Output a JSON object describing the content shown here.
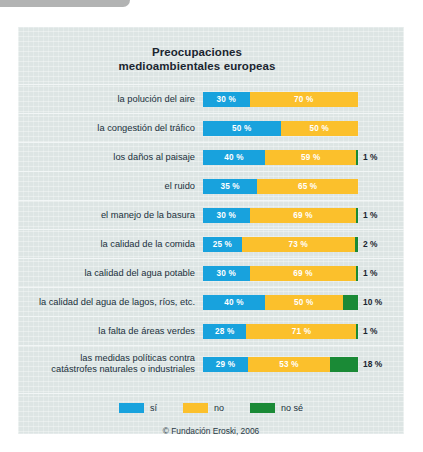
{
  "chart_data": {
    "type": "bar",
    "subtype": "stacked-horizontal-100pct",
    "title": "Preocupaciones medioambientales europeas",
    "title_line1": "Preocupaciones",
    "title_line2": "medioambientales europeas",
    "xlabel": "",
    "ylabel": "",
    "xlim": [
      0,
      100
    ],
    "grid": false,
    "legend_position": "bottom",
    "units": "%",
    "credit": "© Fundación Eroski, 2006",
    "categories": [
      "la polución del aire",
      "la congestión del tráfico",
      "los daños al paisaje",
      "el ruido",
      "el manejo de la basura",
      "la calidad de la comida",
      "la calidad del agua potable",
      "la calidad del agua de lagos, ríos, etc.",
      "la falta de áreas verdes",
      "las medidas políticas contra catástrofes naturales o industriales"
    ],
    "series": [
      {
        "name": "sí",
        "color": "#18a2dd",
        "values": [
          30,
          50,
          40,
          35,
          30,
          25,
          30,
          40,
          28,
          29
        ]
      },
      {
        "name": "no",
        "color": "#fbc02c",
        "values": [
          70,
          50,
          59,
          65,
          69,
          73,
          69,
          50,
          71,
          53
        ]
      },
      {
        "name": "no sé",
        "color": "#1a8a36",
        "values": [
          0,
          0,
          1,
          0,
          1,
          2,
          1,
          10,
          1,
          18
        ]
      }
    ]
  },
  "legend": {
    "items": [
      {
        "label": "sí",
        "color": "#18a2dd"
      },
      {
        "label": "no",
        "color": "#fbc02c"
      },
      {
        "label": "no sé",
        "color": "#1a8a36"
      }
    ]
  },
  "rows": [
    {
      "label": "la polución del aire",
      "label_line2": "",
      "si": 30,
      "no": 70,
      "ns": 0,
      "si_text": "30 %",
      "no_text": "70 %",
      "ns_text": "",
      "outside_text": ""
    },
    {
      "label": "la congestión del tráfico",
      "label_line2": "",
      "si": 50,
      "no": 50,
      "ns": 0,
      "si_text": "50 %",
      "no_text": "50 %",
      "ns_text": "",
      "outside_text": ""
    },
    {
      "label": "los daños al paisaje",
      "label_line2": "",
      "si": 40,
      "no": 59,
      "ns": 1,
      "si_text": "40 %",
      "no_text": "59 %",
      "ns_text": "",
      "outside_text": "1 %"
    },
    {
      "label": "el ruido",
      "label_line2": "",
      "si": 35,
      "no": 65,
      "ns": 0,
      "si_text": "35 %",
      "no_text": "65 %",
      "ns_text": "",
      "outside_text": ""
    },
    {
      "label": "el manejo de la basura",
      "label_line2": "",
      "si": 30,
      "no": 69,
      "ns": 1,
      "si_text": "30 %",
      "no_text": "69 %",
      "ns_text": "",
      "outside_text": "1 %"
    },
    {
      "label": "la calidad de la comida",
      "label_line2": "",
      "si": 25,
      "no": 73,
      "ns": 2,
      "si_text": "25 %",
      "no_text": "73 %",
      "ns_text": "",
      "outside_text": "2 %"
    },
    {
      "label": "la calidad del agua potable",
      "label_line2": "",
      "si": 30,
      "no": 69,
      "ns": 1,
      "si_text": "30 %",
      "no_text": "69 %",
      "ns_text": "",
      "outside_text": "1 %"
    },
    {
      "label": "la calidad del agua de lagos, ríos, etc.",
      "label_line2": "",
      "si": 40,
      "no": 50,
      "ns": 10,
      "si_text": "40 %",
      "no_text": "50 %",
      "ns_text": "",
      "outside_text": "10 %"
    },
    {
      "label": "la falta de áreas verdes",
      "label_line2": "",
      "si": 28,
      "no": 71,
      "ns": 1,
      "si_text": "28 %",
      "no_text": "71 %",
      "ns_text": "",
      "outside_text": "1 %"
    },
    {
      "label": "las medidas políticas contra",
      "label_line2": "catástrofes naturales o industriales",
      "si": 29,
      "no": 53,
      "ns": 18,
      "si_text": "29 %",
      "no_text": "53 %",
      "ns_text": "",
      "outside_text": "18 %"
    }
  ],
  "credit": {
    "text": "© Fundación Eroski, 2006"
  },
  "colors": {
    "si": "#18a2dd",
    "no": "#fbc02c",
    "no_se": "#1a8a36",
    "panel_bg": "#dde5e4",
    "text": "#20303c"
  }
}
